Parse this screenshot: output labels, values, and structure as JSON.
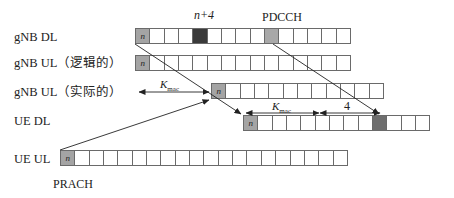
{
  "rows": [
    {
      "id": "gnb-dl",
      "label": "gNB DL",
      "cells": 15,
      "start_label": "n",
      "highlights": [
        {
          "index": 0,
          "type": "n"
        },
        {
          "index": 4,
          "type": "dark"
        },
        {
          "index": 9,
          "type": "mid"
        }
      ]
    },
    {
      "id": "gnb-ul-logical",
      "label": "gNB UL（逻辑的）",
      "cells": 15,
      "start_label": "n",
      "highlights": [
        {
          "index": 0,
          "type": "n"
        }
      ]
    },
    {
      "id": "gnb-ul-actual",
      "label": "gNB UL（实际的）",
      "cells": 12,
      "start_label": "n",
      "highlights": [
        {
          "index": 0,
          "type": "n"
        }
      ]
    },
    {
      "id": "ue-dl",
      "label": "UE DL",
      "cells": 13,
      "start_label": "n",
      "highlights": [
        {
          "index": 0,
          "type": "n"
        },
        {
          "index": 9,
          "type": "mid2"
        }
      ]
    },
    {
      "id": "ue-ul",
      "label": "UE UL",
      "cells": 20,
      "start_label": "n",
      "highlights": [
        {
          "index": 0,
          "type": "n"
        }
      ]
    }
  ],
  "annotations": {
    "n_plus_4": "n+4",
    "pdcch": "PDCCH",
    "prach": "PRACH",
    "kmac_main": "K",
    "kmac_sub": "mac",
    "four": "4"
  }
}
